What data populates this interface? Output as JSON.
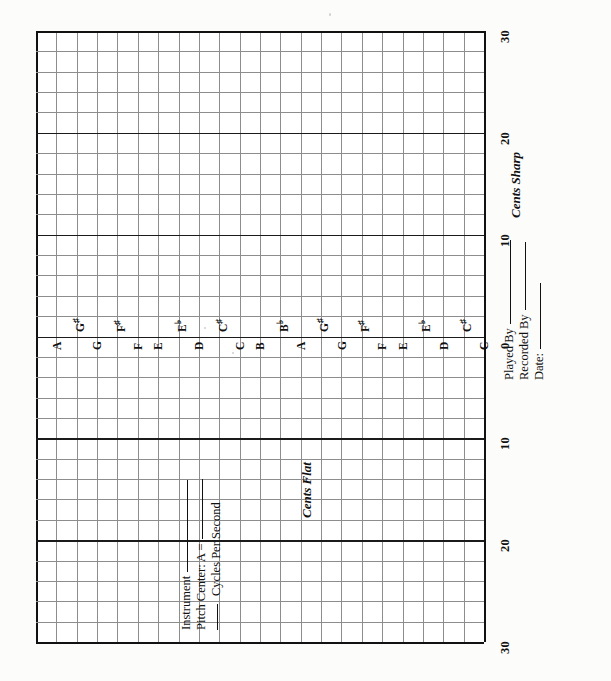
{
  "document": {
    "kind": "intonation-recording-chart",
    "orientation": "landscape-rotated-90"
  },
  "chart_data": {
    "type": "table",
    "title": "",
    "xlabel": "",
    "ylabel": "",
    "grid": true,
    "legend": null,
    "axis_sharp": {
      "label": "Cents Sharp",
      "ticks": [
        "0",
        "10",
        "20",
        "30"
      ],
      "range": [
        0,
        30
      ]
    },
    "axis_flat": {
      "label": "Cents Flat",
      "ticks": [
        "0",
        "10",
        "20",
        "30"
      ],
      "range": [
        0,
        30
      ]
    },
    "minor_division_cents": 2,
    "major_division_cents": 10,
    "note_axis": {
      "label": "",
      "naturals": [
        "A",
        "G",
        "F",
        "E",
        "D",
        "C",
        "B",
        "A",
        "G",
        "F",
        "E",
        "D",
        "C"
      ],
      "accidentals": [
        {
          "letter": "G",
          "symbol": "♯",
          "text": "G♯"
        },
        {
          "letter": "F",
          "symbol": "♯",
          "text": "F♯"
        },
        {
          "letter": "E",
          "symbol": "♭",
          "text": "E♭"
        },
        {
          "letter": "C",
          "symbol": "♯",
          "text": "C♯"
        },
        {
          "letter": "B",
          "symbol": "♭",
          "text": "B♭"
        },
        {
          "letter": "G",
          "symbol": "♯",
          "text": "G♯"
        },
        {
          "letter": "F",
          "symbol": "♯",
          "text": "F♯"
        },
        {
          "letter": "E",
          "symbol": "♭",
          "text": "E♭"
        },
        {
          "letter": "C",
          "symbol": "♯",
          "text": "C♯"
        }
      ],
      "sequence": [
        "A",
        "G♯",
        "G",
        "F♯",
        "F",
        "E",
        "E♭",
        "D",
        "C♯",
        "C",
        "B",
        "B♭",
        "A",
        "G♯",
        "G",
        "F♯",
        "F",
        "E",
        "E♭",
        "D",
        "C♯",
        "C"
      ]
    },
    "series": [],
    "values": []
  },
  "labels": {
    "cents_sharp": "Cents Sharp",
    "cents_flat": "Cents Flat",
    "ticks_sharp": [
      "0",
      "10",
      "20",
      "30"
    ],
    "ticks_flat": [
      "0",
      "10",
      "20",
      "30"
    ]
  },
  "notes": {
    "naturals": [
      "A",
      "G",
      "F",
      "E",
      "D",
      "C",
      "B",
      "A",
      "G",
      "F",
      "E",
      "D",
      "C"
    ],
    "accidentals": [
      "G♯",
      "F♯",
      "E♭",
      "C♯",
      "B♭",
      "G♯",
      "F♯",
      "E♭",
      "C♯"
    ]
  },
  "form_right": {
    "played_by": "Played By",
    "recorded_by": "Recorded By",
    "date": "Date:",
    "played_by_value": "",
    "recorded_by_value": "",
    "date_value": ""
  },
  "form_left": {
    "instrument": "Instrument",
    "pitch_center": "Pitch Center:  A =",
    "cycles_per_second": "Cycles Per Second",
    "instrument_value": "",
    "pitch_center_value": "",
    "cycles_value": ""
  }
}
